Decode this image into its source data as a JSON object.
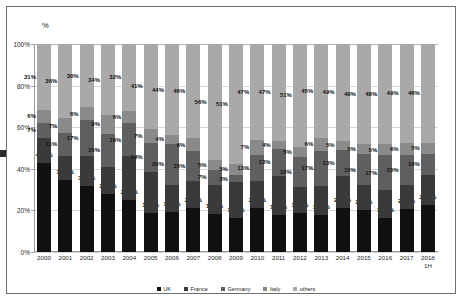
{
  "chart_data": {
    "type": "bar",
    "subtype": "stacked-percentage",
    "title": "",
    "xlabel": "",
    "ylabel": "%",
    "ylim": [
      0,
      100
    ],
    "ytick_labels": [
      "0%",
      "20%",
      "40%",
      "60%",
      "80%",
      "100%"
    ],
    "ytick_values": [
      0,
      20,
      40,
      60,
      80,
      100
    ],
    "grid": true,
    "legend_position": "bottom",
    "categories": [
      "2000",
      "2001",
      "2002",
      "2003",
      "2004",
      "2005",
      "2006",
      "2007",
      "2008",
      "2009",
      "2010",
      "2011",
      "2012",
      "2013",
      "2014",
      "2015",
      "2016",
      "2017",
      "2018\n1H"
    ],
    "series": [
      {
        "name": "UK",
        "color": "#111111",
        "values": [
          41.7,
          34.6,
          31.4,
          27.7,
          24.9,
          18.9,
          19.3,
          21.4,
          18.6,
          14.7,
          21.6,
          18.2,
          19.2,
          17.6,
          22.6,
          20.7,
          16.4,
          21.5,
          21.9
        ],
        "labels": [
          "41.7%",
          "34.6%",
          "31.4%",
          "27.7%",
          "24.9%",
          "18.9%",
          "19.3%",
          "21.4%",
          "18.6%",
          "14.7%",
          "21.6%",
          "18.2%",
          "19.2%",
          "17.6%",
          "22.6%",
          "20.7%",
          "16.4%",
          "21.5%",
          "21.9%"
        ]
      },
      {
        "name": "France",
        "color": "#3a3a3a",
        "values": [
          12,
          12,
          14,
          13,
          21,
          20,
          13,
          13,
          14,
          15,
          13,
          19,
          13,
          14,
          16,
          12,
          13,
          12,
          14
        ],
        "labels": [
          "12%",
          "12%",
          "14%",
          "13%",
          "21%",
          "20%",
          "13%",
          "13%",
          "14%",
          "15%",
          "13%",
          "19%",
          "13%",
          "14%",
          "16%",
          "12%",
          "13%",
          "12%",
          "14%"
        ]
      },
      {
        "name": "Germany",
        "color": "#5f5f5f",
        "values": [
          7,
          11,
          17,
          16,
          16,
          14,
          20,
          15,
          7,
          3,
          13,
          13,
          15,
          17,
          13,
          15,
          17,
          15,
          10
        ],
        "labels": [
          "7%",
          "11%",
          "17%",
          "16%",
          "16%",
          "14%",
          "20%",
          "15%",
          "7%",
          "3%",
          "13%",
          "13%",
          "15%",
          "17%",
          "13%",
          "15%",
          "17%",
          "15%",
          "10%"
        ]
      },
      {
        "name": "Italy",
        "color": "#8a8a8a",
        "values": [
          6,
          7,
          6,
          9,
          6,
          7,
          4,
          6,
          5,
          5,
          7,
          4,
          5,
          6,
          5,
          5,
          5,
          6,
          5
        ],
        "labels": [
          "6%",
          "7%",
          "6%",
          "9%",
          "6%",
          "7%",
          "4%",
          "6%",
          "5%",
          "5%",
          "7%",
          "4%",
          "5%",
          "6%",
          "5%",
          "5%",
          "5%",
          "6%",
          "5%"
        ]
      },
      {
        "name": "others",
        "color": "#a9a9a9",
        "values": [
          31,
          36,
          30,
          34,
          32,
          41,
          44,
          46,
          56,
          51,
          47,
          47,
          51,
          45,
          49,
          49,
          48,
          49,
          46
        ],
        "labels": [
          "31%",
          "36%",
          "30%",
          "34%",
          "32%",
          "41%",
          "44%",
          "46%",
          "56%",
          "51%",
          "47%",
          "47%",
          "51%",
          "45%",
          "49%",
          "49%",
          "48%",
          "49%",
          "46%"
        ]
      }
    ],
    "last_bar_top_label": "41%"
  },
  "legend": [
    {
      "label": "UK",
      "color": "#111111"
    },
    {
      "label": "France",
      "color": "#3a3a3a"
    },
    {
      "label": "Germany",
      "color": "#5f5f5f"
    },
    {
      "label": "Italy",
      "color": "#8a8a8a"
    },
    {
      "label": "others",
      "color": "#a9a9a9"
    }
  ],
  "axis": {
    "unit_label": "%"
  }
}
